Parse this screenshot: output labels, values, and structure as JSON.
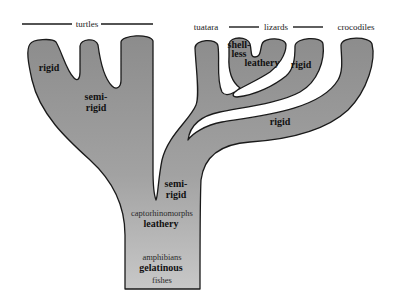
{
  "diagram": {
    "type": "evolutionary tree of eggshell types",
    "colors": {
      "fill_top": "#8e8e8e",
      "fill_bottom": "#c4c4c4",
      "outline": "#1a1a1a",
      "background": "#ffffff"
    },
    "groups": {
      "turtles": "turtles",
      "tuatara": "tuatara",
      "lizards": "lizards",
      "crocodiles": "crocodiles"
    },
    "branch_labels": {
      "turtle_left": "rigid",
      "turtle_center_line1": "semi-",
      "turtle_center_line2": "rigid",
      "lizard_shell_line1": "shell-",
      "lizard_shell_line2": "less",
      "lizard_leathery": "leathery",
      "lizard_rigid": "rigid",
      "crocodile_rigid": "rigid",
      "trunk_semi_line1": "semi-",
      "trunk_semi_line2": "rigid"
    },
    "trunk_labels": {
      "captorhinomorphs": "captorhinomorphs",
      "leathery": "leathery",
      "amphibians": "amphibians",
      "gelatinous": "gelatinous",
      "fishes": "fishes"
    }
  }
}
